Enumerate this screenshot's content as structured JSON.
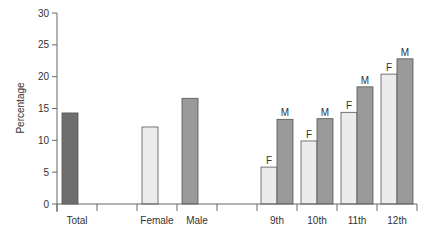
{
  "chart_data": {
    "type": "bar",
    "title": "",
    "xlabel": "",
    "ylabel": "Percentage",
    "ylim": [
      0,
      30
    ],
    "yticks": [
      0,
      5,
      10,
      15,
      20,
      25,
      30
    ],
    "grid": false,
    "legend": null,
    "groups": [
      {
        "label": "Total",
        "bars": [
          {
            "series": "Total",
            "value": 14.3,
            "annotation": ""
          }
        ]
      },
      {
        "label": "",
        "bars": []
      },
      {
        "label": "Female",
        "bars": [
          {
            "series": "Female",
            "value": 12.1,
            "annotation": ""
          }
        ]
      },
      {
        "label": "Male",
        "bars": [
          {
            "series": "Male",
            "value": 16.6,
            "annotation": ""
          }
        ]
      },
      {
        "label": "",
        "bars": []
      },
      {
        "label": "9th",
        "bars": [
          {
            "series": "Female",
            "value": 5.8,
            "annotation": "F"
          },
          {
            "series": "Male",
            "value": 13.3,
            "annotation": "M"
          }
        ]
      },
      {
        "label": "10th",
        "bars": [
          {
            "series": "Female",
            "value": 9.9,
            "annotation": "F"
          },
          {
            "series": "Male",
            "value": 13.4,
            "annotation": "M"
          }
        ]
      },
      {
        "label": "11th",
        "bars": [
          {
            "series": "Female",
            "value": 14.4,
            "annotation": "F"
          },
          {
            "series": "Male",
            "value": 18.4,
            "annotation": "M"
          }
        ]
      },
      {
        "label": "12th",
        "bars": [
          {
            "series": "Female",
            "value": 20.4,
            "annotation": "F"
          },
          {
            "series": "Male",
            "value": 22.8,
            "annotation": "M"
          }
        ]
      }
    ],
    "categories": [
      "Total",
      "Female",
      "Male",
      "9th",
      "10th",
      "11th",
      "12th"
    ],
    "series": [
      {
        "name": "Total",
        "values": [
          14.3,
          null,
          null,
          null,
          null,
          null,
          null
        ]
      },
      {
        "name": "Female",
        "values": [
          null,
          12.1,
          null,
          5.8,
          9.9,
          14.4,
          20.4
        ]
      },
      {
        "name": "Male",
        "values": [
          null,
          null,
          16.6,
          13.3,
          13.4,
          18.4,
          22.8
        ]
      }
    ],
    "colors": {
      "Total": "#6e6e6e",
      "Female": "#ececec",
      "Male": "#9a9a9a",
      "axis": "#666666",
      "bar_stroke": "#555555"
    }
  }
}
